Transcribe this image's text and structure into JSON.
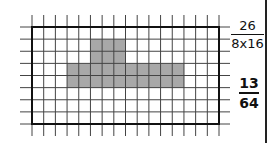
{
  "figure": {
    "grid": {
      "rows": 8,
      "cols": 16,
      "shaded_cells": [
        {
          "row": 1,
          "col": 5
        },
        {
          "row": 1,
          "col": 6
        },
        {
          "row": 1,
          "col": 7
        },
        {
          "row": 2,
          "col": 5
        },
        {
          "row": 2,
          "col": 6
        },
        {
          "row": 2,
          "col": 7
        },
        {
          "row": 3,
          "col": 3
        },
        {
          "row": 3,
          "col": 4
        },
        {
          "row": 3,
          "col": 5
        },
        {
          "row": 3,
          "col": 6
        },
        {
          "row": 3,
          "col": 7
        },
        {
          "row": 3,
          "col": 8
        },
        {
          "row": 3,
          "col": 9
        },
        {
          "row": 3,
          "col": 10
        },
        {
          "row": 3,
          "col": 11
        },
        {
          "row": 3,
          "col": 12
        },
        {
          "row": 4,
          "col": 3
        },
        {
          "row": 4,
          "col": 4
        },
        {
          "row": 4,
          "col": 5
        },
        {
          "row": 4,
          "col": 6
        },
        {
          "row": 4,
          "col": 7
        },
        {
          "row": 4,
          "col": 8
        },
        {
          "row": 4,
          "col": 9
        },
        {
          "row": 4,
          "col": 10
        },
        {
          "row": 4,
          "col": 11
        },
        {
          "row": 4,
          "col": 12
        }
      ],
      "shaded_count": 26,
      "fill_color": "#a8a8a8",
      "line_color": "#444444",
      "border_color": "#111111"
    },
    "fraction_1": {
      "numerator": "26",
      "denominator": "8x16"
    },
    "fraction_2": {
      "numerator": "13",
      "denominator": "64"
    }
  }
}
